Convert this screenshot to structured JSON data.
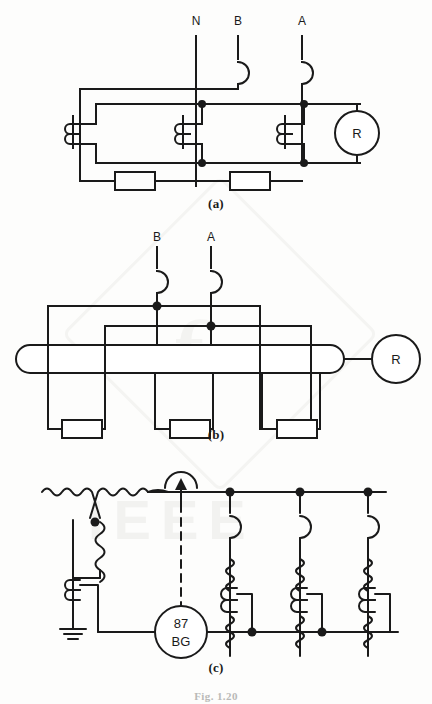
{
  "figure": {
    "number_label": "Fig. 1.20",
    "watermark": "IEEE"
  },
  "captions": {
    "a": "(a)",
    "b": "(b)",
    "c": "(c)"
  },
  "panel_a": {
    "title": "(a)",
    "description": "High-impedance bus differential with individual current transformers per phase",
    "phase_labels": [
      "N",
      "B",
      "A"
    ],
    "relay_label": "R",
    "component_counts": {
      "current_transformers": 3,
      "resistors": 2,
      "circuit_breakers": 2,
      "junction_dots": 4,
      "relays": 1
    },
    "colors": {
      "line": "#1a1a1a",
      "background": "#ffffff"
    }
  },
  "panel_b": {
    "title": "(b)",
    "description": "Core balance / linear coupler bus differential scheme",
    "phase_labels": [
      "B",
      "A"
    ],
    "relay_label": "R",
    "component_counts": {
      "linear_couplers": 1,
      "resistors": 3,
      "circuit_breakers": 2,
      "junction_dots": 2,
      "relays": 1
    },
    "colors": {
      "line": "#1a1a1a",
      "background": "#ffffff"
    }
  },
  "panel_c": {
    "title": "(c)",
    "description": "Bus ground differential protection with grounded-wye source and three feeders",
    "relay_label_top": "87",
    "relay_label_bottom": "BG",
    "trip_arrow": "trip-signal",
    "component_counts": {
      "feeders": 3,
      "circuit_breakers": 3,
      "current_transformers": 7,
      "relays": 1,
      "grounds": 1,
      "junction_dots": 7
    },
    "colors": {
      "line": "#1a1a1a",
      "dashed_trip": "#1a1a1a",
      "background": "#ffffff"
    }
  }
}
